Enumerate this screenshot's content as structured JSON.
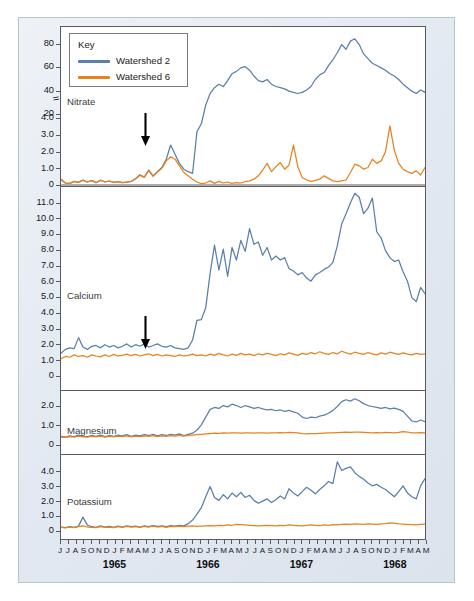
{
  "figure": {
    "ylabel": "Concentration (mg/liter)",
    "series_colors": {
      "watershed2": "#5b7fa8",
      "watershed6": "#e8821e"
    },
    "frame_color": "#b9c4d2",
    "axis_color": "#5b5b5b",
    "axis_break_glyph": "≈"
  },
  "legend": {
    "title": "Key",
    "entries": [
      {
        "label": "Watershed 2",
        "color": "#5b7fa8"
      },
      {
        "label": "Watershed 6",
        "color": "#e8821e"
      }
    ]
  },
  "panels": [
    {
      "name": "Nitrate",
      "ticks_lower": [
        "0",
        "1.0",
        "2.0",
        "3.0",
        "4.0"
      ],
      "ticks_upper": [
        "20",
        "40",
        "60",
        "80"
      ]
    },
    {
      "name": "Calcium",
      "ticks": [
        "0",
        "1.0",
        "2.0",
        "3.0",
        "4.0",
        "5.0",
        "6.0",
        "7.0",
        "8.0",
        "9.0",
        "10.0",
        "11.0"
      ]
    },
    {
      "name": "Magnesium",
      "ticks": [
        "0",
        "1.0",
        "2.0"
      ]
    },
    {
      "name": "Potassium",
      "ticks": [
        "0",
        "1.0",
        "2.0",
        "3.0",
        "4.0"
      ]
    }
  ],
  "xaxis": {
    "months": [
      "J",
      "J",
      "A",
      "S",
      "O",
      "N",
      "D",
      "J",
      "F",
      "M",
      "A",
      "M",
      "J",
      "J",
      "A",
      "S",
      "O",
      "N",
      "D",
      "J",
      "F",
      "M",
      "A",
      "M",
      "J",
      "J",
      "A",
      "S",
      "O",
      "N",
      "D",
      "J",
      "F",
      "M",
      "A",
      "M",
      "J",
      "J",
      "A",
      "S",
      "O",
      "N",
      "D",
      "J",
      "F",
      "M",
      "A",
      "M"
    ],
    "years": [
      "1965",
      "1966",
      "1967",
      "1968"
    ]
  },
  "annotations": [
    {
      "name": "deforestation-arrow",
      "panel": "Nitrate",
      "symbol": "down-arrow"
    },
    {
      "name": "deforestation-arrow",
      "panel": "Calcium",
      "symbol": "down-arrow"
    }
  ],
  "chart_data": {
    "type": "line",
    "title": "",
    "xlabel": "",
    "ylabel": "Concentration (mg/liter)",
    "x_months": [
      "J",
      "J",
      "A",
      "S",
      "O",
      "N",
      "D",
      "J",
      "F",
      "M",
      "A",
      "M",
      "J",
      "J",
      "A",
      "S",
      "O",
      "N",
      "D",
      "J",
      "F",
      "M",
      "A",
      "M",
      "J",
      "J",
      "A",
      "S",
      "O",
      "N",
      "D",
      "J",
      "F",
      "M",
      "A",
      "M",
      "J",
      "J",
      "A",
      "S",
      "O",
      "N",
      "D",
      "J",
      "F",
      "M",
      "A",
      "M"
    ],
    "x_years": [
      "1965",
      "1966",
      "1967",
      "1968"
    ],
    "legend_position": "top-left",
    "grid": false,
    "panels": [
      {
        "name": "Nitrate",
        "ylim": [
          0,
          90
        ],
        "broken_axis": true,
        "break_between": [
          4.0,
          20
        ],
        "ytick_lower": [
          0,
          1.0,
          2.0,
          3.0,
          4.0
        ],
        "ytick_upper": [
          20,
          40,
          60,
          80
        ],
        "annotation": "down-arrow at Feb 1966",
        "series": [
          {
            "name": "Watershed 2",
            "color": "#5b7fa8",
            "values": [
              0.35,
              0.12,
              0.1,
              0.22,
              0.16,
              0.3,
              0.18,
              0.26,
              0.14,
              0.3,
              0.18,
              0.24,
              0.16,
              0.2,
              0.14,
              0.18,
              0.22,
              0.38,
              0.62,
              0.48,
              0.9,
              0.55,
              0.82,
              1.05,
              1.55,
              2.4,
              1.85,
              1.3,
              0.95,
              0.8,
              0.7,
              3.2,
              12.0,
              28.0,
              38.0,
              43.0,
              46.0,
              44.0,
              49.0,
              55.0,
              57.0,
              60.0,
              61.0,
              58.0,
              53.0,
              49.0,
              48.0,
              50.0,
              46.0,
              44.0,
              43.0,
              42.0,
              40.0,
              39.0,
              38.0,
              39.0,
              41.0,
              44.0,
              50.0,
              54.0,
              56.0,
              62.0,
              67.0,
              73.0,
              80.0,
              76.0,
              83.0,
              85.0,
              80.0,
              72.0,
              68.0,
              64.0,
              62.0,
              60.0,
              58.0,
              55.0,
              53.0,
              50.0,
              46.0,
              43.0,
              40.0,
              38.0,
              41.0,
              39.0
            ]
          },
          {
            "name": "Watershed 6",
            "color": "#e8821e",
            "values": [
              0.3,
              0.12,
              0.1,
              0.22,
              0.16,
              0.28,
              0.18,
              0.26,
              0.14,
              0.28,
              0.18,
              0.24,
              0.16,
              0.2,
              0.14,
              0.18,
              0.22,
              0.36,
              0.58,
              0.46,
              0.86,
              0.52,
              0.78,
              1.0,
              1.45,
              1.7,
              1.55,
              1.15,
              0.75,
              0.55,
              0.35,
              0.18,
              0.08,
              0.12,
              0.25,
              0.1,
              0.22,
              0.12,
              0.18,
              0.1,
              0.15,
              0.12,
              0.2,
              0.25,
              0.35,
              0.55,
              0.9,
              1.3,
              0.8,
              1.1,
              1.35,
              0.95,
              1.2,
              2.4,
              1.1,
              0.45,
              0.3,
              0.22,
              0.28,
              0.35,
              0.55,
              0.4,
              0.25,
              0.2,
              0.25,
              0.3,
              0.75,
              1.25,
              1.15,
              0.95,
              1.05,
              1.55,
              1.3,
              1.45,
              2.0,
              3.55,
              2.1,
              1.3,
              0.95,
              0.8,
              0.7,
              0.85,
              0.6,
              1.05
            ]
          }
        ]
      },
      {
        "name": "Calcium",
        "ylim": [
          0,
          11.8
        ],
        "ytick": [
          0,
          1.0,
          2.0,
          3.0,
          4.0,
          5.0,
          6.0,
          7.0,
          8.0,
          9.0,
          10.0,
          11.0
        ],
        "annotation": "down-arrow at Feb 1966",
        "series": [
          {
            "name": "Watershed 2",
            "color": "#5b7fa8",
            "values": [
              1.45,
              1.7,
              1.8,
              1.75,
              2.45,
              1.85,
              1.7,
              1.9,
              1.95,
              1.8,
              2.0,
              1.85,
              1.95,
              1.8,
              1.9,
              2.05,
              1.85,
              2.0,
              1.9,
              2.05,
              1.85,
              1.95,
              2.05,
              1.9,
              1.85,
              1.95,
              1.8,
              1.75,
              1.7,
              1.8,
              2.3,
              3.55,
              3.6,
              4.35,
              6.55,
              8.35,
              6.75,
              8.1,
              6.35,
              8.2,
              7.4,
              8.65,
              7.95,
              9.4,
              8.4,
              8.55,
              7.7,
              8.2,
              7.4,
              7.65,
              7.4,
              7.55,
              6.85,
              6.7,
              6.45,
              6.6,
              6.25,
              6.05,
              6.45,
              6.6,
              6.8,
              6.95,
              7.25,
              8.3,
              9.7,
              10.35,
              11.05,
              11.65,
              11.4,
              10.35,
              10.7,
              11.35,
              9.2,
              8.8,
              8.0,
              7.55,
              7.3,
              7.4,
              6.65,
              6.05,
              5.0,
              4.75,
              5.65,
              5.25
            ]
          },
          {
            "name": "Watershed 6",
            "color": "#e8821e",
            "values": [
              1.1,
              1.25,
              1.2,
              1.35,
              1.25,
              1.3,
              1.2,
              1.35,
              1.28,
              1.22,
              1.35,
              1.25,
              1.38,
              1.28,
              1.32,
              1.4,
              1.3,
              1.38,
              1.28,
              1.35,
              1.42,
              1.3,
              1.38,
              1.28,
              1.35,
              1.3,
              1.25,
              1.35,
              1.28,
              1.32,
              1.4,
              1.3,
              1.35,
              1.28,
              1.4,
              1.32,
              1.45,
              1.35,
              1.28,
              1.4,
              1.32,
              1.45,
              1.35,
              1.4,
              1.3,
              1.42,
              1.35,
              1.45,
              1.38,
              1.3,
              1.42,
              1.35,
              1.48,
              1.4,
              1.32,
              1.45,
              1.38,
              1.5,
              1.42,
              1.55,
              1.45,
              1.38,
              1.5,
              1.42,
              1.58,
              1.48,
              1.4,
              1.52,
              1.45,
              1.38,
              1.5,
              1.42,
              1.35,
              1.48,
              1.4,
              1.52,
              1.45,
              1.38,
              1.48,
              1.4,
              1.35,
              1.45,
              1.38,
              1.42
            ]
          }
        ]
      },
      {
        "name": "Magnesium",
        "ylim": [
          0,
          2.65
        ],
        "ytick": [
          0,
          1.0,
          2.0
        ],
        "series": [
          {
            "name": "Watershed 2",
            "color": "#5b7fa8",
            "values": [
              0.45,
              0.42,
              0.48,
              0.44,
              0.52,
              0.46,
              0.44,
              0.5,
              0.46,
              0.52,
              0.44,
              0.5,
              0.46,
              0.52,
              0.48,
              0.54,
              0.46,
              0.52,
              0.48,
              0.54,
              0.5,
              0.56,
              0.48,
              0.54,
              0.5,
              0.56,
              0.52,
              0.58,
              0.5,
              0.56,
              0.62,
              0.78,
              1.05,
              1.45,
              1.85,
              1.95,
              1.9,
              2.05,
              1.98,
              2.12,
              2.05,
              1.95,
              2.05,
              1.98,
              1.9,
              1.95,
              1.88,
              1.82,
              1.85,
              1.78,
              1.82,
              1.75,
              1.8,
              1.72,
              1.65,
              1.45,
              1.38,
              1.45,
              1.42,
              1.5,
              1.55,
              1.65,
              1.8,
              2.0,
              2.25,
              2.35,
              2.28,
              2.4,
              2.3,
              2.15,
              2.05,
              2.0,
              1.95,
              1.9,
              1.95,
              1.88,
              1.92,
              1.85,
              1.75,
              1.5,
              1.25,
              1.2,
              1.3,
              1.22
            ]
          },
          {
            "name": "Watershed 6",
            "color": "#e8821e",
            "values": [
              0.42,
              0.4,
              0.44,
              0.42,
              0.46,
              0.43,
              0.41,
              0.45,
              0.43,
              0.46,
              0.42,
              0.45,
              0.43,
              0.47,
              0.44,
              0.48,
              0.43,
              0.47,
              0.44,
              0.48,
              0.45,
              0.49,
              0.44,
              0.48,
              0.45,
              0.49,
              0.46,
              0.5,
              0.46,
              0.5,
              0.52,
              0.54,
              0.56,
              0.58,
              0.6,
              0.62,
              0.61,
              0.63,
              0.62,
              0.64,
              0.63,
              0.62,
              0.64,
              0.63,
              0.62,
              0.64,
              0.63,
              0.62,
              0.64,
              0.63,
              0.65,
              0.64,
              0.66,
              0.65,
              0.64,
              0.6,
              0.58,
              0.6,
              0.59,
              0.61,
              0.62,
              0.63,
              0.64,
              0.65,
              0.66,
              0.67,
              0.66,
              0.68,
              0.67,
              0.66,
              0.65,
              0.64,
              0.65,
              0.64,
              0.66,
              0.65,
              0.64,
              0.66,
              0.7,
              0.68,
              0.64,
              0.63,
              0.65,
              0.64
            ]
          }
        ]
      },
      {
        "name": "Potassium",
        "ylim": [
          0,
          4.9
        ],
        "ytick": [
          0,
          1.0,
          2.0,
          3.0,
          4.0
        ],
        "series": [
          {
            "name": "Watershed 2",
            "color": "#5b7fa8",
            "values": [
              0.22,
              0.18,
              0.25,
              0.2,
              0.28,
              0.9,
              0.35,
              0.24,
              0.2,
              0.3,
              0.22,
              0.26,
              0.2,
              0.28,
              0.22,
              0.3,
              0.24,
              0.28,
              0.22,
              0.3,
              0.25,
              0.32,
              0.26,
              0.3,
              0.24,
              0.32,
              0.28,
              0.34,
              0.3,
              0.45,
              0.7,
              1.1,
              1.55,
              2.3,
              3.0,
              2.25,
              2.05,
              2.45,
              2.15,
              2.55,
              2.3,
              2.6,
              2.25,
              2.4,
              2.05,
              1.85,
              2.0,
              2.15,
              1.9,
              2.1,
              2.35,
              2.15,
              2.85,
              2.55,
              2.35,
              2.65,
              2.95,
              2.75,
              2.5,
              2.8,
              3.05,
              3.35,
              3.2,
              4.7,
              4.1,
              4.25,
              4.35,
              3.95,
              3.7,
              3.5,
              3.25,
              3.05,
              3.15,
              2.95,
              2.8,
              2.55,
              2.3,
              2.65,
              3.05,
              2.55,
              2.3,
              2.15,
              3.05,
              3.55
            ]
          },
          {
            "name": "Watershed 6",
            "color": "#e8821e",
            "values": [
              0.2,
              0.16,
              0.22,
              0.18,
              0.24,
              0.3,
              0.22,
              0.2,
              0.18,
              0.24,
              0.2,
              0.22,
              0.18,
              0.24,
              0.2,
              0.26,
              0.22,
              0.24,
              0.2,
              0.26,
              0.22,
              0.28,
              0.22,
              0.26,
              0.2,
              0.26,
              0.24,
              0.28,
              0.24,
              0.28,
              0.3,
              0.26,
              0.28,
              0.3,
              0.32,
              0.3,
              0.34,
              0.32,
              0.36,
              0.34,
              0.4,
              0.38,
              0.36,
              0.34,
              0.32,
              0.3,
              0.32,
              0.34,
              0.32,
              0.3,
              0.34,
              0.32,
              0.36,
              0.34,
              0.32,
              0.3,
              0.34,
              0.36,
              0.34,
              0.32,
              0.36,
              0.34,
              0.38,
              0.36,
              0.4,
              0.42,
              0.4,
              0.44,
              0.42,
              0.4,
              0.44,
              0.42,
              0.4,
              0.44,
              0.46,
              0.5,
              0.48,
              0.44,
              0.42,
              0.4,
              0.38,
              0.36,
              0.4,
              0.42
            ]
          }
        ]
      }
    ]
  }
}
